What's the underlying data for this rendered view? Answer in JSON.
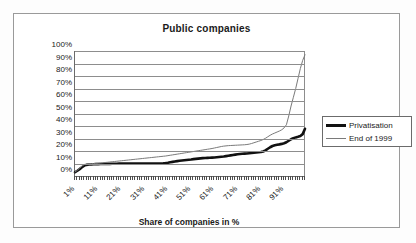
{
  "chart_data": {
    "type": "line",
    "title": "Public companies",
    "xlabel": "Share of companies in %",
    "ylabel": "Ownership stake C1 in %",
    "xlim": [
      1,
      100
    ],
    "ylim": [
      0,
      100
    ],
    "grid": true,
    "legend_position": "right",
    "x_tick_labels": [
      "1%",
      "11%",
      "21%",
      "31%",
      "41%",
      "51%",
      "61%",
      "71%",
      "81%",
      "91%"
    ],
    "x_tick_values": [
      1,
      11,
      21,
      31,
      41,
      51,
      61,
      71,
      81,
      91
    ],
    "y_tick_labels": [
      "100%",
      "90%",
      "80%",
      "70%",
      "60%",
      "50%",
      "40%",
      "30%",
      "20%",
      "10%",
      "0%"
    ],
    "y_tick_values": [
      100,
      90,
      80,
      70,
      60,
      50,
      40,
      30,
      20,
      10,
      0
    ],
    "x": [
      1,
      2,
      3,
      4,
      5,
      6,
      7,
      8,
      9,
      10,
      11,
      12,
      13,
      14,
      15,
      16,
      17,
      18,
      19,
      20,
      21,
      22,
      23,
      24,
      25,
      26,
      27,
      28,
      29,
      30,
      31,
      32,
      33,
      34,
      35,
      36,
      37,
      38,
      39,
      40,
      41,
      42,
      43,
      44,
      45,
      46,
      47,
      48,
      49,
      50,
      51,
      52,
      53,
      54,
      55,
      56,
      57,
      58,
      59,
      60,
      61,
      62,
      63,
      64,
      65,
      66,
      67,
      68,
      69,
      70,
      71,
      72,
      73,
      74,
      75,
      76,
      77,
      78,
      79,
      80,
      81,
      82,
      83,
      84,
      85,
      86,
      87,
      88,
      89,
      90,
      91,
      92,
      93,
      94,
      95,
      96,
      97,
      98,
      99,
      100
    ],
    "series": [
      {
        "name": "Privatisation",
        "color": "#111111",
        "line_width": 2.6,
        "values": [
          3.0,
          4.2,
          5.5,
          7.0,
          8.3,
          8.9,
          9.2,
          9.3,
          9.4,
          9.5,
          9.5,
          9.6,
          9.6,
          9.7,
          9.7,
          9.7,
          9.8,
          9.8,
          9.8,
          9.9,
          9.9,
          9.9,
          9.9,
          10.0,
          10.0,
          10.0,
          10.0,
          10.0,
          10.0,
          10.0,
          10.0,
          10.0,
          10.0,
          10.0,
          10.0,
          10.0,
          10.0,
          10.0,
          10.1,
          10.3,
          10.6,
          11.0,
          11.3,
          11.6,
          11.9,
          12.2,
          12.4,
          12.6,
          12.8,
          13.0,
          13.2,
          13.5,
          13.7,
          13.9,
          14.1,
          14.3,
          14.4,
          14.5,
          14.6,
          14.7,
          14.8,
          15.0,
          15.2,
          15.4,
          15.6,
          15.9,
          16.2,
          16.5,
          16.8,
          17.1,
          17.4,
          17.6,
          17.8,
          17.9,
          18.0,
          18.2,
          18.4,
          18.6,
          18.8,
          19.0,
          19.2,
          19.6,
          20.5,
          21.8,
          23.0,
          24.0,
          24.6,
          25.0,
          25.3,
          25.7,
          26.2,
          27.0,
          28.2,
          29.4,
          30.3,
          30.9,
          31.4,
          32.0,
          33.5,
          37.8
        ]
      },
      {
        "name": "End of 1999",
        "color": "#7a7a7a",
        "line_width": 1.0,
        "values": [
          3.2,
          4.6,
          6.2,
          8.0,
          9.2,
          9.6,
          9.8,
          9.9,
          10.0,
          10.1,
          10.2,
          10.4,
          10.6,
          10.8,
          11.0,
          11.2,
          11.4,
          11.6,
          11.8,
          12.0,
          12.2,
          12.4,
          12.6,
          12.8,
          13.0,
          13.2,
          13.4,
          13.6,
          13.8,
          14.0,
          14.2,
          14.4,
          14.6,
          14.8,
          15.0,
          15.2,
          15.4,
          15.6,
          15.8,
          16.0,
          16.3,
          16.6,
          16.9,
          17.2,
          17.5,
          17.8,
          18.1,
          18.4,
          18.7,
          19.0,
          19.3,
          19.6,
          19.9,
          20.2,
          20.5,
          20.8,
          21.1,
          21.4,
          21.7,
          22.0,
          22.4,
          22.8,
          23.2,
          23.6,
          23.9,
          24.1,
          24.3,
          24.4,
          24.5,
          24.6,
          24.7,
          24.8,
          24.9,
          25.0,
          25.2,
          25.5,
          26.0,
          26.6,
          27.2,
          27.8,
          28.4,
          29.2,
          30.2,
          31.4,
          32.6,
          33.6,
          34.4,
          35.2,
          36.0,
          37.0,
          38.5,
          41.0,
          48.0,
          56.0,
          63.0,
          70.0,
          78.0,
          86.0,
          92.5,
          97.0
        ]
      }
    ]
  }
}
